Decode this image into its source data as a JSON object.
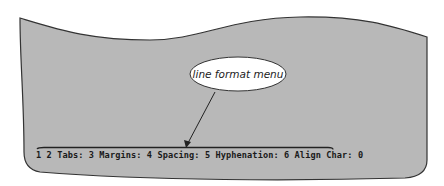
{
  "figure": {
    "screen_color": "#b8b8b8",
    "outline_color": "#333333",
    "callout": {
      "label": "line format menu",
      "fill": "#ffffff"
    }
  },
  "menu": {
    "prefix": "1",
    "items": [
      {
        "key": "2",
        "label": "Tabs:"
      },
      {
        "key": "3",
        "label": "Margins:"
      },
      {
        "key": "4",
        "label": "Spacing:"
      },
      {
        "key": "5",
        "label": "Hyphenation:"
      },
      {
        "key": "6",
        "label": "Align Char:"
      }
    ],
    "current_value": "0"
  }
}
